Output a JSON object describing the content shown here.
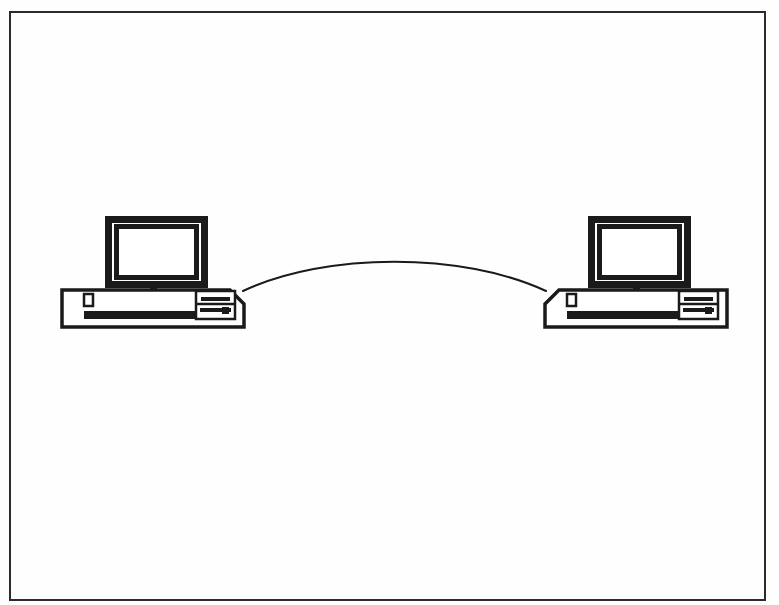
{
  "figure": {
    "kind": "line-art-diagram",
    "background_color": "#fefefe",
    "ink_color": "#1a1a1a",
    "screen_fill": "#ffffff",
    "caption": "",
    "title": ""
  },
  "frame": {
    "name": "figure-border",
    "x": 10,
    "y": 12,
    "width": 755,
    "height": 588,
    "stroke_color": "#2b2b2b",
    "stroke_width": 2
  },
  "nodes": [
    {
      "id": "computer-left",
      "label": "",
      "role": "workstation",
      "monitor": {
        "x": 105,
        "y": 216,
        "width": 103,
        "height": 72,
        "bezel_width": 7,
        "screen_x": 119,
        "screen_y": 229,
        "screen_width": 75,
        "screen_height": 46
      },
      "stand": {
        "x": 150,
        "y": 288,
        "width": 7,
        "height": 9
      },
      "base": {
        "x": 62,
        "y": 290,
        "width": 182,
        "height": 37,
        "bevel_corner": "top-right",
        "bevel_size": 14
      },
      "power_button": {
        "x": 84,
        "y": 294,
        "width": 9,
        "height": 12
      },
      "slot": {
        "x": 84,
        "y": 311,
        "width": 122,
        "height": 8
      },
      "drive_bay": {
        "x": 196,
        "y": 291,
        "width": 39,
        "height": 28,
        "slots": 2,
        "eject_button": true
      }
    },
    {
      "id": "computer-right",
      "label": "",
      "role": "workstation",
      "monitor": {
        "x": 588,
        "y": 216,
        "width": 103,
        "height": 72,
        "bezel_width": 7,
        "screen_x": 602,
        "screen_y": 229,
        "screen_width": 75,
        "screen_height": 46
      },
      "stand": {
        "x": 633,
        "y": 288,
        "width": 7,
        "height": 9
      },
      "base": {
        "x": 545,
        "y": 290,
        "width": 182,
        "height": 37,
        "bevel_corner": "top-left",
        "bevel_size": 14
      },
      "power_button": {
        "x": 567,
        "y": 294,
        "width": 9,
        "height": 12
      },
      "slot": {
        "x": 567,
        "y": 311,
        "width": 122,
        "height": 8
      },
      "drive_bay": {
        "x": 679,
        "y": 291,
        "width": 39,
        "height": 28,
        "slots": 2,
        "eject_button": true
      }
    }
  ],
  "link": {
    "id": "cable-link",
    "label": "",
    "from": "computer-left",
    "to": "computer-right",
    "style": "arc",
    "start_x": 243,
    "start_y": 291,
    "end_x": 546,
    "end_y": 291,
    "apex_x": 394,
    "apex_y": 258,
    "stroke_color": "#1a1a1a",
    "stroke_width": 2
  }
}
